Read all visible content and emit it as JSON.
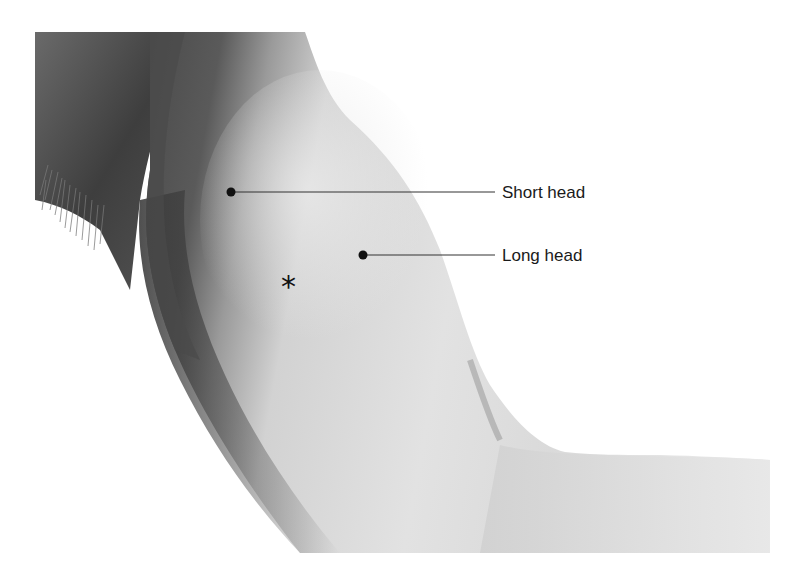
{
  "figure": {
    "background_color": "#ffffff",
    "skin_tones": {
      "light": "#e4e4e4",
      "mid": "#c8c8c8",
      "dark": "#555555",
      "shadow": "#3a3a3a"
    }
  },
  "annotations": [
    {
      "label": "Short head",
      "dot": {
        "x": 231,
        "y": 192
      },
      "line_end_x": 495,
      "label_x": 502,
      "label_y": 184
    },
    {
      "label": "Long head",
      "dot": {
        "x": 363,
        "y": 255
      },
      "line_end_x": 495,
      "label_x": 502,
      "label_y": 247
    }
  ],
  "marker": {
    "symbol": "*",
    "x": 281,
    "y": 272
  }
}
